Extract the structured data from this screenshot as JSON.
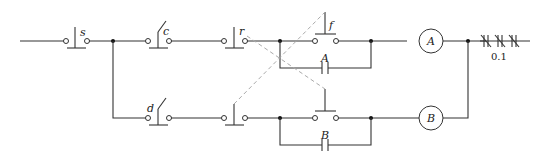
{
  "diagram": {
    "type": "ladder control circuit",
    "labels": {
      "stop_switch": "s",
      "contact_c": "c",
      "contact_r": "r",
      "contact_f": "f",
      "contact_d": "d",
      "aux_contact_a": "A",
      "aux_contact_b": "B",
      "coil_a": "A",
      "coil_b": "B",
      "overload_value": "0.1"
    },
    "colors": {
      "wire": "#333333",
      "mechanical_link": "#aaaaaa",
      "background": "#ffffff"
    }
  }
}
